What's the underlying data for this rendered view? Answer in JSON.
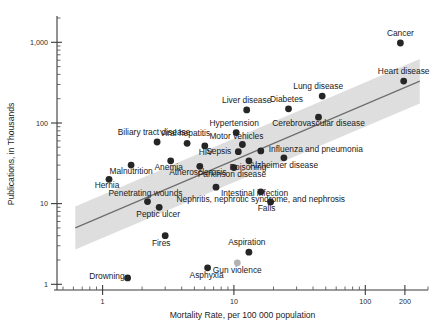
{
  "chart_data": {
    "type": "scatter",
    "title": "",
    "xlabel": "Mortality Rate, per 100 000 population",
    "ylabel": "Publications, in Thousands",
    "xscale": "log",
    "yscale": "log",
    "xlim": [
      0.45,
      300
    ],
    "ylim": [
      0.85,
      2000
    ],
    "grid": false,
    "legend": null,
    "xticks": [
      {
        "value": 1,
        "label": "1"
      },
      {
        "value": 10,
        "label": "10"
      },
      {
        "value": 100,
        "label": "100"
      },
      {
        "value": 200,
        "label": "200"
      }
    ],
    "yticks": [
      {
        "value": 1,
        "label": "1"
      },
      {
        "value": 10,
        "label": "10"
      },
      {
        "value": 100,
        "label": "100"
      },
      {
        "value": 1000,
        "label": "1,000"
      }
    ],
    "points": [
      {
        "label": "Cancer",
        "x": 185.0,
        "y": 980.0,
        "color": "#262626",
        "label_dx": 0,
        "label_dy": -7,
        "anchor": "middle"
      },
      {
        "label": "Heart disease",
        "x": 196.0,
        "y": 330.0,
        "color": "#262626",
        "label_dx": 0,
        "label_dy": -7,
        "anchor": "middle"
      },
      {
        "label": "Lung disease",
        "x": 47.0,
        "y": 215.0,
        "color": "#262626",
        "label_dx": -4,
        "label_dy": -7,
        "anchor": "middle"
      },
      {
        "label": "Diabetes",
        "x": 26.0,
        "y": 150.0,
        "color": "#262626",
        "label_dx": -2,
        "label_dy": -7,
        "anchor": "middle"
      },
      {
        "label": "Cerebrovascular disease",
        "x": 44.0,
        "y": 118.0,
        "color": "#262626",
        "label_dx": 0,
        "label_dy": 9,
        "anchor": "middle"
      },
      {
        "label": "Liver disease",
        "x": 12.5,
        "y": 145.0,
        "color": "#262626",
        "label_dx": 0,
        "label_dy": -7,
        "anchor": "middle"
      },
      {
        "label": "Hypertension",
        "x": 10.4,
        "y": 76.0,
        "color": "#262626",
        "label_dx": -2,
        "label_dy": -7,
        "anchor": "middle"
      },
      {
        "label": "Motor vehicles",
        "x": 11.6,
        "y": 54.0,
        "color": "#262626",
        "label_dx": -6,
        "label_dy": -6,
        "anchor": "middle"
      },
      {
        "label": "Influenza and pneumonia",
        "x": 16.0,
        "y": 45.0,
        "color": "#262626",
        "label_dx": 8,
        "label_dy": 1,
        "anchor": "start"
      },
      {
        "label": "Sepsis",
        "x": 10.8,
        "y": 44.0,
        "color": "#262626",
        "label_dx": -7,
        "label_dy": 2,
        "anchor": "end"
      },
      {
        "label": "Poisoning",
        "x": 13.0,
        "y": 34.0,
        "color": "#262626",
        "label_dx": -1,
        "label_dy": 9,
        "anchor": "middle"
      },
      {
        "label": "Alzheimer disease",
        "x": 24.0,
        "y": 37.0,
        "color": "#262626",
        "label_dx": 0,
        "label_dy": 10,
        "anchor": "middle"
      },
      {
        "label": "Viral hepatitis",
        "x": 4.4,
        "y": 56.0,
        "color": "#262626",
        "label_dx": -2,
        "label_dy": -7,
        "anchor": "middle"
      },
      {
        "label": "HIV",
        "x": 6.0,
        "y": 52.0,
        "color": "#262626",
        "label_dx": 1,
        "label_dy": 9,
        "anchor": "middle"
      },
      {
        "label": "Biliary tract disease",
        "x": 2.6,
        "y": 58.0,
        "color": "#262626",
        "label_dx": -3,
        "label_dy": -7,
        "anchor": "middle"
      },
      {
        "label": "Anemia",
        "x": 3.3,
        "y": 34.0,
        "color": "#262626",
        "label_dx": -2,
        "label_dy": 9,
        "anchor": "middle"
      },
      {
        "label": "Atherosclerosis",
        "x": 5.5,
        "y": 29.0,
        "color": "#262626",
        "label_dx": -2,
        "label_dy": 9,
        "anchor": "middle"
      },
      {
        "label": "Parkinson disease",
        "x": 10.0,
        "y": 28.0,
        "color": "#262626",
        "label_dx": -2,
        "label_dy": 9,
        "anchor": "middle"
      },
      {
        "label": "Malnutrition",
        "x": 1.65,
        "y": 30.0,
        "color": "#262626",
        "label_dx": 0,
        "label_dy": 9,
        "anchor": "middle"
      },
      {
        "label": "Hernia",
        "x": 1.12,
        "y": 20.0,
        "color": "#262626",
        "label_dx": -2,
        "label_dy": 9,
        "anchor": "middle"
      },
      {
        "label": "Penetrating wounds",
        "x": 2.2,
        "y": 10.6,
        "color": "#262626",
        "label_dx": -2,
        "label_dy": -6,
        "anchor": "middle"
      },
      {
        "label": "Intestinal infection",
        "x": 7.3,
        "y": 16.0,
        "color": "#262626",
        "label_dx": 5,
        "label_dy": 9,
        "anchor": "start"
      },
      {
        "label": "Nephritis, nephrotic syndrome, and nephrosis",
        "x": 16.0,
        "y": 14.0,
        "color": "#262626",
        "label_dx": 0,
        "label_dy": 10,
        "anchor": "middle"
      },
      {
        "label": "Falls",
        "x": 19.0,
        "y": 10.5,
        "color": "#262626",
        "label_dx": -4,
        "label_dy": 9,
        "anchor": "middle"
      },
      {
        "label": "Peptic ulcer",
        "x": 2.7,
        "y": 9.0,
        "color": "#262626",
        "label_dx": -1,
        "label_dy": 10,
        "anchor": "middle"
      },
      {
        "label": "Fires",
        "x": 3.0,
        "y": 4.0,
        "color": "#262626",
        "label_dx": -4,
        "label_dy": 10,
        "anchor": "middle"
      },
      {
        "label": "Aspiration",
        "x": 13.0,
        "y": 2.5,
        "color": "#262626",
        "label_dx": -2,
        "label_dy": -7,
        "anchor": "middle"
      },
      {
        "label": "Drowning",
        "x": 1.55,
        "y": 1.2,
        "color": "#262626",
        "label_dx": -3,
        "label_dy": 1,
        "anchor": "end"
      },
      {
        "label": "Asphyxia",
        "x": 6.3,
        "y": 1.6,
        "color": "#262626",
        "label_dx": -1,
        "label_dy": 10,
        "anchor": "middle"
      },
      {
        "label": "Gun violence",
        "x": 10.6,
        "y": 1.85,
        "color": "#b2b2b2",
        "label_dx": 0,
        "label_dy": 10,
        "anchor": "middle"
      }
    ],
    "fit_line": {
      "x_start": 0.62,
      "y_start": 5.0,
      "x_end": 260.0,
      "y_end": 330.0,
      "band_start_lower": 2.7,
      "band_start_upper": 9.2,
      "band_end_lower": 175.0,
      "band_end_upper": 620.0
    }
  }
}
